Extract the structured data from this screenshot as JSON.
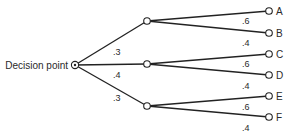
{
  "diagram": {
    "type": "decision-tree",
    "root": {
      "label": "Decision point",
      "x": 75,
      "y": 65
    },
    "chance_nodes": [
      {
        "x": 147,
        "y": 21,
        "prob_from_root": ".3",
        "prob_label_pos": [
          113,
          55
        ]
      },
      {
        "x": 147,
        "y": 64,
        "prob_from_root": ".4",
        "prob_label_pos": [
          113,
          78
        ]
      },
      {
        "x": 147,
        "y": 106,
        "prob_from_root": ".3",
        "prob_label_pos": [
          113,
          101
        ]
      }
    ],
    "outcomes": [
      {
        "label": "A",
        "parent": 0,
        "x": 269,
        "y": 11,
        "prob": ".6",
        "prob_label_pos": [
          242,
          24
        ]
      },
      {
        "label": "B",
        "parent": 0,
        "x": 269,
        "y": 33,
        "prob": ".4",
        "prob_label_pos": [
          242,
          46
        ]
      },
      {
        "label": "C",
        "parent": 1,
        "x": 269,
        "y": 54,
        "prob": ".6",
        "prob_label_pos": [
          242,
          67
        ]
      },
      {
        "label": "D",
        "parent": 1,
        "x": 269,
        "y": 75,
        "prob": ".4",
        "prob_label_pos": [
          242,
          89
        ]
      },
      {
        "label": "E",
        "parent": 2,
        "x": 269,
        "y": 96,
        "prob": ".6",
        "prob_label_pos": [
          242,
          110
        ]
      },
      {
        "label": "F",
        "parent": 2,
        "x": 269,
        "y": 117,
        "prob": ".4",
        "prob_label_pos": [
          242,
          131
        ]
      }
    ]
  }
}
